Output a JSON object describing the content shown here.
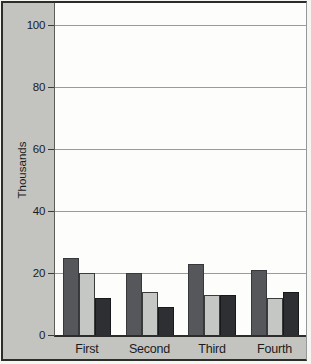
{
  "chart_data": {
    "type": "bar",
    "title": "",
    "xlabel": "",
    "ylabel": "Thousands",
    "categories": [
      "First",
      "Second",
      "Third",
      "Fourth"
    ],
    "series": [
      {
        "name": "series-1-dark-gray",
        "color": "#56575a",
        "border_color": "#37383b",
        "values": [
          25,
          20,
          23,
          21
        ]
      },
      {
        "name": "series-2-light-gray",
        "color": "#c5c7c4",
        "border_color": "#3b3b3b",
        "values": [
          20,
          14,
          13,
          12
        ]
      },
      {
        "name": "series-3-black",
        "color": "#2e2f32",
        "border_color": "#18191b",
        "values": [
          12,
          9,
          13,
          14
        ]
      }
    ],
    "ylim": [
      0,
      100
    ],
    "yticks": [
      0,
      20,
      40,
      60,
      80,
      100
    ],
    "grid": "horizontal",
    "legend": "none"
  },
  "colors": {
    "card_background": "#c3c4c0",
    "plot_background": "#fdfdfb",
    "gridline": "#9b9b9b",
    "axis": "#2c2c2a",
    "tick": "#3a3a38",
    "text": "#1c1c1c"
  }
}
